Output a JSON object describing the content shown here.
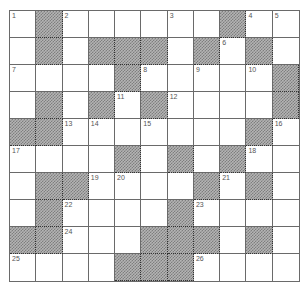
{
  "puzzle": {
    "type": "crossword",
    "rows": 10,
    "cols": 11,
    "legend": {
      "#": "shaded block",
      "_": "empty white cell",
      "number": "clue-numbered white cell"
    },
    "grid": [
      [
        "1",
        "#",
        "2",
        "_",
        "_",
        "_",
        "3",
        "_",
        "#",
        "4",
        "5"
      ],
      [
        "_",
        "#",
        "_",
        "#",
        "#",
        "#",
        "_",
        "#",
        "6",
        "#",
        "_"
      ],
      [
        "7",
        "_",
        "_",
        "_",
        "#",
        "8",
        "_",
        "9",
        "_",
        "10",
        "#"
      ],
      [
        "_",
        "#",
        "_",
        "#",
        "11",
        "#",
        "12",
        "_",
        "_",
        "_",
        "#"
      ],
      [
        "#",
        "#",
        "13",
        "14",
        "_",
        "15",
        "_",
        "_",
        "_",
        "#",
        "16"
      ],
      [
        "17",
        "_",
        "_",
        "_",
        "#",
        "_",
        "#",
        "_",
        "#",
        "18",
        "_"
      ],
      [
        "_",
        "#",
        "#",
        "19",
        "20",
        "_",
        "_",
        "#",
        "21",
        "#",
        "_"
      ],
      [
        "_",
        "#",
        "22",
        "_",
        "_",
        "_",
        "#",
        "23",
        "_",
        "_",
        "_"
      ],
      [
        "#",
        "#",
        "24",
        "_",
        "_",
        "#",
        "#",
        "#",
        "_",
        "#",
        "_"
      ],
      [
        "25",
        "_",
        "_",
        "_",
        "#",
        "#",
        "#",
        "26",
        "_",
        "_",
        "_"
      ]
    ],
    "clue_numbers": [
      "1",
      "2",
      "3",
      "4",
      "5",
      "6",
      "7",
      "8",
      "9",
      "10",
      "11",
      "12",
      "13",
      "14",
      "15",
      "16",
      "17",
      "18",
      "19",
      "20",
      "21",
      "22",
      "23",
      "24",
      "25",
      "26"
    ],
    "colors": {
      "line": "#6a6a6a",
      "block_light": "#b4b4b4",
      "block_dark": "#7e7e7e",
      "number_text": "#555555",
      "background": "#ffffff"
    }
  }
}
